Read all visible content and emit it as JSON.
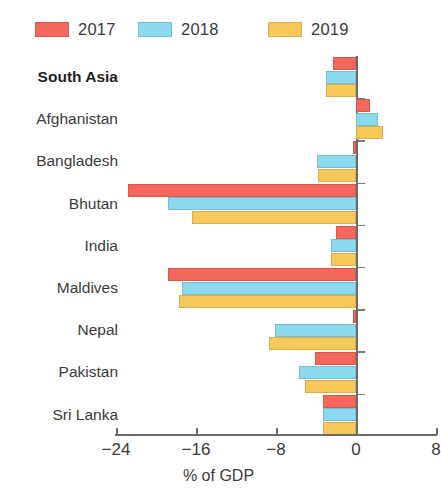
{
  "chart_data": {
    "type": "bar",
    "orientation": "horizontal",
    "title": "",
    "subtitle": "",
    "xlabel": "% of GDP",
    "ylabel": "",
    "xlim": [
      -26,
      8
    ],
    "xticks": [
      -24,
      -16,
      -8,
      0,
      8
    ],
    "xtick_labels": [
      "−24",
      "−16",
      "−8",
      "0",
      "8"
    ],
    "grid": false,
    "legend_position": "top",
    "categories": [
      "South Asia",
      "Afghanistan",
      "Bangladesh",
      "Bhutan",
      "India",
      "Maldives",
      "Nepal",
      "Pakistan",
      "Sri Lanka"
    ],
    "bold_categories": [
      "South Asia"
    ],
    "series": [
      {
        "name": "2017",
        "color": "#F4675A",
        "values": [
          -2.3,
          1.4,
          -0.3,
          -22.8,
          -2.0,
          -18.8,
          -0.3,
          -4.1,
          -3.3
        ]
      },
      {
        "name": "2018",
        "color": "#8BD9EF",
        "values": [
          -3.0,
          2.2,
          -3.9,
          -18.8,
          -2.5,
          -17.4,
          -8.1,
          -5.7,
          -3.3
        ]
      },
      {
        "name": "2019",
        "color": "#F8C95A",
        "values": [
          -3.0,
          2.7,
          -3.8,
          -16.4,
          -2.5,
          -17.7,
          -8.7,
          -5.1,
          -3.3
        ]
      }
    ]
  },
  "legend": {
    "items": [
      {
        "label": "2017",
        "color": "#F4675A"
      },
      {
        "label": "2018",
        "color": "#8BD9EF"
      },
      {
        "label": "2019",
        "color": "#F8C95A"
      }
    ]
  },
  "axis": {
    "x_title": "% of GDP"
  }
}
